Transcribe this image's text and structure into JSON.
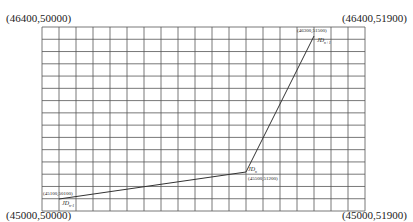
{
  "corners": {
    "top_left": "(46400,50000)",
    "top_right": "(46400,51900)",
    "bottom_left": "(45000,50000)",
    "bottom_right": "(45000,51900)"
  },
  "grid": {
    "left": 42,
    "right": 365,
    "top": 27,
    "bottom": 211,
    "columns": 19,
    "rows": 15,
    "line_color": "#555555"
  },
  "points": [
    {
      "id": "p_n_minus_1",
      "name": "JD",
      "sub": "n-1",
      "coord": "(45100,50100)",
      "x": 59,
      "y": 199
    },
    {
      "id": "p_n",
      "name": "JD",
      "sub": "n",
      "coord": "(45500,51200)",
      "x": 246,
      "y": 172
    },
    {
      "id": "p_n_plus_1",
      "name": "JD",
      "sub": "n+1",
      "coord": "(46300,51500)",
      "x": 314,
      "y": 36
    }
  ],
  "path_color": "#333333"
}
